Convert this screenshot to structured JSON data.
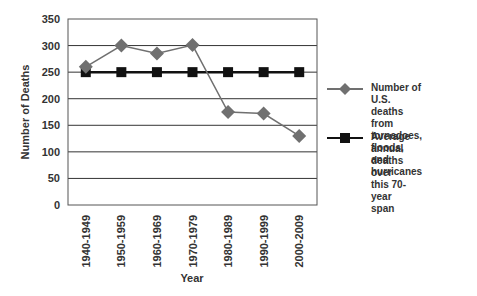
{
  "chart_data": {
    "type": "line",
    "title": "",
    "xlabel": "Year",
    "ylabel": "Number of Deaths",
    "categories": [
      "1940-1949",
      "1950-1959",
      "1960-1969",
      "1970-1979",
      "1980-1989",
      "1990-1999",
      "2000-2009"
    ],
    "ylim": [
      0,
      350
    ],
    "yticks": [
      0,
      50,
      100,
      150,
      200,
      250,
      300,
      350
    ],
    "grid": true,
    "legend_position": "right",
    "series": [
      {
        "name": "Number of U.S. deaths from tornadoes, floods, and hurricanes",
        "marker": "diamond",
        "color": "#707070",
        "values": [
          260,
          300,
          285,
          301,
          175,
          172,
          130
        ]
      },
      {
        "name": "Average annual deaths over this 70-year span",
        "marker": "square",
        "color": "#111111",
        "values": [
          250,
          250,
          250,
          250,
          250,
          250,
          250
        ]
      }
    ]
  },
  "legend": {
    "items": [
      {
        "label": "Number of U.S. deaths\nfrom tornadoes, floods,\nand hurricanes"
      },
      {
        "label": "Average annual deaths\nover this 70-year span"
      }
    ]
  }
}
